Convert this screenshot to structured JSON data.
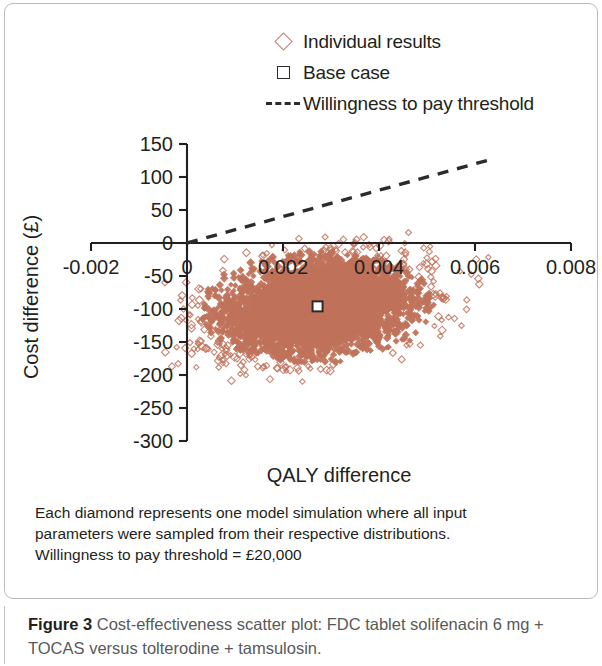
{
  "figure": {
    "caption_label": "Figure 3",
    "caption_text": " Cost-effectiveness scatter plot: FDC tablet solifenacin 6 mg + TOCAS versus tolterodine + tamsulosin.",
    "note_line_1": "Each diamond represents one model simulation where all input",
    "note_line_2": "parameters were sampled from their respective distributions.",
    "note_line_3": "Willingness to pay threshold = £20,000"
  },
  "legend": {
    "items": [
      {
        "key": "diamond-marker-icon",
        "label": "Individual results",
        "color": "#c4806d"
      },
      {
        "key": "square-marker-icon",
        "label": "Base case",
        "color": "#2b2b2b"
      },
      {
        "key": "dashed-line-icon",
        "label": "Willingness to pay threshold",
        "color": "#2b2b2b"
      }
    ]
  },
  "chart_data": {
    "type": "scatter",
    "title": "",
    "xlabel": "QALY difference",
    "ylabel": "Cost difference (£)",
    "xlim": [
      -0.002,
      0.008
    ],
    "ylim": [
      -300,
      150
    ],
    "xticks": [
      -0.002,
      0,
      0.002,
      0.004,
      0.006,
      0.008
    ],
    "xticklabels": [
      "-0.002",
      "0",
      "0.002",
      "0.004",
      "0.006",
      "0.008"
    ],
    "yticks": [
      150,
      100,
      50,
      0,
      -50,
      -100,
      -150,
      -200,
      -250,
      -300
    ],
    "yticklabels": [
      "150",
      "100",
      "50",
      "0",
      "-50",
      "-100",
      "-150",
      "-200",
      "-250",
      "-300"
    ],
    "grid": false,
    "legend_position": "top-center",
    "x_axis_position_y": 0,
    "series": [
      {
        "name": "Individual results",
        "type": "scatter-cloud",
        "marker": "diamond-open",
        "color": "#c0725a",
        "n_points": 5000,
        "cloud_center": [
          0.00272,
          -98
        ],
        "cloud_radius_x": 0.00235,
        "cloud_radius_y": 82,
        "x_range": [
          5e-05,
          0.0062
        ],
        "y_range": [
          -255,
          -5
        ],
        "description": "Dense ellipse of simulation results, all with positive QALY difference and negative cost difference"
      },
      {
        "name": "Base case",
        "type": "point",
        "marker": "square-open",
        "color": "#2b2b2b",
        "x": 0.00272,
        "y": -96
      },
      {
        "name": "Willingness to pay threshold",
        "type": "line",
        "style": "dashed",
        "color": "#2b2b2b",
        "slope_per_qaly": 20000,
        "x": [
          0,
          0.0064
        ],
        "y": [
          0,
          128
        ]
      }
    ]
  }
}
